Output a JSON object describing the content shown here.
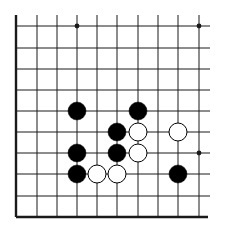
{
  "board": {
    "type": "go-diagram",
    "grid": {
      "cols_x": [
        16,
        37,
        57,
        77,
        97,
        117,
        138,
        158,
        178,
        199
      ],
      "rows_y": [
        26,
        48,
        69,
        90,
        111,
        132,
        153,
        174,
        196,
        217
      ],
      "line_extend_right": 210,
      "line_extend_top": 15
    },
    "edges": [
      "left",
      "bottom"
    ],
    "star_points": [
      {
        "col": 3,
        "row": 0
      },
      {
        "col": 9,
        "row": 0
      },
      {
        "col": 9,
        "row": 6
      }
    ],
    "stones": [
      {
        "color": "black",
        "col": 3,
        "row": 4
      },
      {
        "color": "black",
        "col": 6,
        "row": 4
      },
      {
        "color": "black",
        "col": 5,
        "row": 5
      },
      {
        "color": "white",
        "col": 6,
        "row": 5
      },
      {
        "color": "white",
        "col": 8,
        "row": 5
      },
      {
        "color": "black",
        "col": 3,
        "row": 6
      },
      {
        "color": "black",
        "col": 5,
        "row": 6
      },
      {
        "color": "white",
        "col": 6,
        "row": 6
      },
      {
        "color": "black",
        "col": 3,
        "row": 7
      },
      {
        "color": "white",
        "col": 4,
        "row": 7
      },
      {
        "color": "white",
        "col": 5,
        "row": 7
      },
      {
        "color": "black",
        "col": 8,
        "row": 7
      }
    ],
    "colors": {
      "line": "#1a1a1a",
      "black_stone": "#000000",
      "white_stone": "#ffffff",
      "background": "#ffffff"
    }
  }
}
